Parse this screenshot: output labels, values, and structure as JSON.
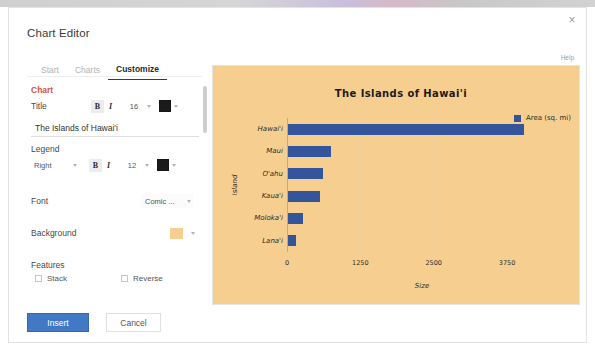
{
  "dialog": {
    "title": "Chart Editor",
    "close_label": "×",
    "help_label": "Help"
  },
  "tabs": [
    {
      "label": "Start",
      "active": false
    },
    {
      "label": "Charts",
      "active": false
    },
    {
      "label": "Customize",
      "active": true
    }
  ],
  "panel": {
    "chart_section_label": "Chart",
    "title_row": {
      "label": "Title",
      "bold_label": "B",
      "italic_label": "I",
      "font_size": "16",
      "color": "#1b1b1b"
    },
    "title_input": {
      "value": "The Islands of Hawai'i",
      "placeholder": "Chart title"
    },
    "legend_section_label": "Legend",
    "legend_row": {
      "position": "Right",
      "bold_label": "B",
      "italic_label": "I",
      "font_size": "12",
      "color": "#1b1b1b"
    },
    "font_row": {
      "label": "Font",
      "value": "Comic ..."
    },
    "background_row": {
      "label": "Background",
      "color": "#f6cf90"
    },
    "features_label": "Features",
    "features": [
      {
        "label": "Stack",
        "checked": false
      },
      {
        "label": "Reverse",
        "checked": false
      }
    ]
  },
  "footer": {
    "insert_label": "Insert",
    "cancel_label": "Cancel"
  },
  "chart_data": {
    "type": "bar",
    "orientation": "horizontal",
    "title": "The Islands of Hawai'i",
    "xlabel": "Size",
    "ylabel": "Island",
    "categories": [
      "Hawai'i",
      "Maui",
      "O'ahu",
      "Kaua'i",
      "Moloka'i",
      "Lana'i"
    ],
    "series": [
      {
        "name": "Area (sq. mi)",
        "color": "#34559c",
        "values": [
          4028,
          727,
          597,
          552,
          260,
          141
        ]
      }
    ],
    "xticks": [
      0,
      1250,
      2500,
      3750
    ],
    "xlim": [
      0,
      4600
    ],
    "grid": true,
    "legend_position": "right",
    "plot_background": "#f6cf90"
  }
}
